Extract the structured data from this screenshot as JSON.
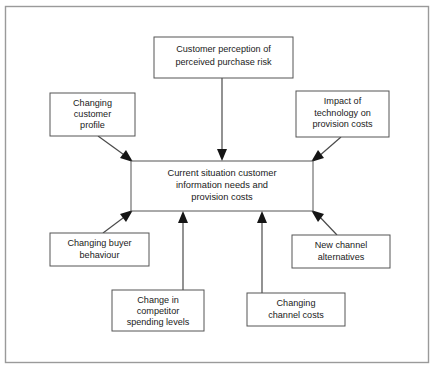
{
  "diagram": {
    "type": "influence-diagram",
    "background_color": "#ffffff",
    "frame": {
      "stroke_color": "#9a9a9a"
    },
    "box_stroke_color": "#555555",
    "text_color": "#1a1a1a",
    "central_node": {
      "id": "central",
      "lines": [
        "Current situation customer",
        "information needs and",
        "provision costs"
      ],
      "x": 131,
      "y": 161,
      "width": 182,
      "height": 50
    },
    "factor_nodes": [
      {
        "id": "customer-perception",
        "lines": [
          "Customer perception of",
          "perceived purchase risk"
        ],
        "x": 154,
        "y": 37,
        "width": 139,
        "height": 41
      },
      {
        "id": "changing-customer-profile",
        "lines": [
          "Changing",
          "customer",
          "profile"
        ],
        "x": 50,
        "y": 93,
        "width": 85,
        "height": 43
      },
      {
        "id": "impact-of-technology",
        "lines": [
          "Impact of",
          "technology on",
          "provision costs"
        ],
        "x": 296,
        "y": 91,
        "width": 93,
        "height": 46
      },
      {
        "id": "changing-buyer-behaviour",
        "lines": [
          "Changing buyer",
          "behaviour"
        ],
        "x": 50,
        "y": 233,
        "width": 99,
        "height": 33
      },
      {
        "id": "new-channel-alternatives",
        "lines": [
          "New channel",
          "alternatives"
        ],
        "x": 292,
        "y": 235,
        "width": 98,
        "height": 33
      },
      {
        "id": "change-in-competitor-spending",
        "lines": [
          "Change in",
          "competitor",
          "spending levels"
        ],
        "x": 112,
        "y": 290,
        "width": 92,
        "height": 41
      },
      {
        "id": "changing-channel-costs",
        "lines": [
          "Changing",
          "channel  costs"
        ],
        "x": 247,
        "y": 293,
        "width": 98,
        "height": 33
      }
    ],
    "connectors": [
      {
        "from": "customer-perception",
        "to": "central",
        "orientation": "vertical-down"
      },
      {
        "from": "changing-customer-profile",
        "to": "central",
        "orientation": "diagonal-down-right"
      },
      {
        "from": "impact-of-technology",
        "to": "central",
        "orientation": "diagonal-down-left"
      },
      {
        "from": "changing-buyer-behaviour",
        "to": "central",
        "orientation": "diagonal-up-right"
      },
      {
        "from": "new-channel-alternatives",
        "to": "central",
        "orientation": "diagonal-up-left"
      },
      {
        "from": "change-in-competitor-spending",
        "to": "central",
        "orientation": "vertical-up"
      },
      {
        "from": "changing-channel-costs",
        "to": "central",
        "orientation": "vertical-up"
      }
    ]
  }
}
